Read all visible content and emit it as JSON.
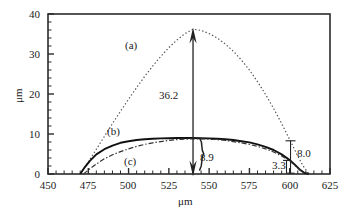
{
  "chart_data": {
    "type": "line",
    "title": "",
    "xlabel": "μm",
    "ylabel": "μm",
    "xlim": [
      450,
      625
    ],
    "ylim": [
      0,
      40
    ],
    "xticks": [
      450,
      475,
      500,
      525,
      550,
      575,
      600,
      625
    ],
    "yticks": [
      0,
      10,
      20,
      30,
      40
    ],
    "xtick_labels": [
      "450",
      "475",
      "500",
      "525",
      "550",
      "575",
      "600",
      "625"
    ],
    "ytick_labels": [
      "0",
      "10",
      "20",
      "30",
      "40"
    ],
    "minor_ticks_per_major": 5,
    "grid": false,
    "legend": "inline-curve-labels",
    "series": [
      {
        "name": "(a)",
        "style": "dotted",
        "label": "(a)",
        "peak_x": 540,
        "peak_y": 36.2,
        "x_start": 470,
        "x_end": 612,
        "points": [
          [
            470,
            0.0
          ],
          [
            475,
            3.0
          ],
          [
            480,
            6.2
          ],
          [
            485,
            9.4
          ],
          [
            490,
            12.6
          ],
          [
            495,
            15.7
          ],
          [
            500,
            18.7
          ],
          [
            505,
            21.6
          ],
          [
            510,
            24.4
          ],
          [
            515,
            27.0
          ],
          [
            520,
            29.4
          ],
          [
            525,
            31.6
          ],
          [
            530,
            33.5
          ],
          [
            535,
            35.1
          ],
          [
            540,
            36.2
          ],
          [
            545,
            35.9
          ],
          [
            550,
            35.1
          ],
          [
            555,
            34.0
          ],
          [
            560,
            32.5
          ],
          [
            565,
            30.7
          ],
          [
            570,
            28.5
          ],
          [
            575,
            26.0
          ],
          [
            580,
            23.1
          ],
          [
            585,
            19.9
          ],
          [
            590,
            16.4
          ],
          [
            595,
            12.6
          ],
          [
            600,
            8.6
          ],
          [
            604,
            5.3
          ],
          [
            608,
            2.2
          ],
          [
            612,
            0.0
          ]
        ]
      },
      {
        "name": "(b)",
        "style": "solid",
        "label": "(b)",
        "x_start": 470,
        "x_end": 610,
        "points": [
          [
            470,
            0.0
          ],
          [
            473,
            1.8
          ],
          [
            476,
            3.3
          ],
          [
            480,
            4.9
          ],
          [
            485,
            6.2
          ],
          [
            490,
            7.1
          ],
          [
            495,
            7.8
          ],
          [
            500,
            8.2
          ],
          [
            505,
            8.5
          ],
          [
            510,
            8.7
          ],
          [
            515,
            8.8
          ],
          [
            520,
            8.9
          ],
          [
            525,
            8.95
          ],
          [
            530,
            9.0
          ],
          [
            535,
            9.0
          ],
          [
            540,
            9.0
          ],
          [
            545,
            8.95
          ],
          [
            550,
            8.9
          ],
          [
            555,
            8.8
          ],
          [
            560,
            8.7
          ],
          [
            565,
            8.5
          ],
          [
            570,
            8.2
          ],
          [
            575,
            7.9
          ],
          [
            580,
            7.4
          ],
          [
            585,
            6.8
          ],
          [
            590,
            6.0
          ],
          [
            595,
            4.9
          ],
          [
            600,
            3.5
          ],
          [
            603,
            2.4
          ],
          [
            606,
            1.2
          ],
          [
            609,
            0.3
          ],
          [
            612,
            0.0
          ]
        ]
      },
      {
        "name": "(c)",
        "style": "dash-dot",
        "label": "(c)",
        "x_start": 472,
        "x_end": 610,
        "points": [
          [
            472,
            0.0
          ],
          [
            476,
            1.3
          ],
          [
            480,
            2.5
          ],
          [
            485,
            3.8
          ],
          [
            490,
            4.8
          ],
          [
            495,
            5.6
          ],
          [
            500,
            6.3
          ],
          [
            505,
            6.9
          ],
          [
            510,
            7.4
          ],
          [
            515,
            7.8
          ],
          [
            520,
            8.1
          ],
          [
            525,
            8.4
          ],
          [
            530,
            8.6
          ],
          [
            535,
            8.7
          ],
          [
            540,
            8.8
          ],
          [
            545,
            8.8
          ],
          [
            550,
            8.7
          ],
          [
            555,
            8.6
          ],
          [
            560,
            8.4
          ],
          [
            565,
            8.1
          ],
          [
            570,
            7.8
          ],
          [
            575,
            7.4
          ],
          [
            580,
            6.9
          ],
          [
            585,
            6.3
          ],
          [
            590,
            5.5
          ],
          [
            595,
            4.5
          ],
          [
            600,
            3.3
          ],
          [
            603,
            2.2
          ],
          [
            606,
            1.1
          ],
          [
            609,
            0.2
          ],
          [
            612,
            0.0
          ]
        ]
      }
    ],
    "annotations": [
      {
        "name": "peak-arrow-value",
        "text": "36.2",
        "x": 540,
        "y": 19.5,
        "arrow": "double-vertical",
        "from_y": 0,
        "to_y": 36.2
      },
      {
        "name": "brace-value",
        "text": "8.9",
        "x": 547,
        "y": 5.0,
        "arrow": "down-brace",
        "from_y": 8.9,
        "to_y": 0
      },
      {
        "name": "right-height-value",
        "text": "8.0",
        "x": 603,
        "y": 5.5,
        "arrow": "vertical-caps",
        "from_y": 8.0,
        "to_y": 0
      },
      {
        "name": "right-offset-value",
        "text": "3.3",
        "x": 593,
        "y": 2.0
      }
    ],
    "curve_labels": [
      {
        "text": "(a)",
        "x": 503,
        "y": 31.0
      },
      {
        "text": "(b)",
        "x": 492,
        "y": 11.6
      },
      {
        "text": "(c)",
        "x": 510,
        "y": 3.4
      }
    ]
  },
  "axes": {
    "x_axis_title": "μm",
    "y_axis_title": "μm"
  },
  "colors": {
    "frame": "#2b2b2b",
    "curve_a": "#555555",
    "curve_b": "#111111",
    "curve_c": "#333333",
    "annotation": "#222222",
    "background": "#ffffff"
  }
}
